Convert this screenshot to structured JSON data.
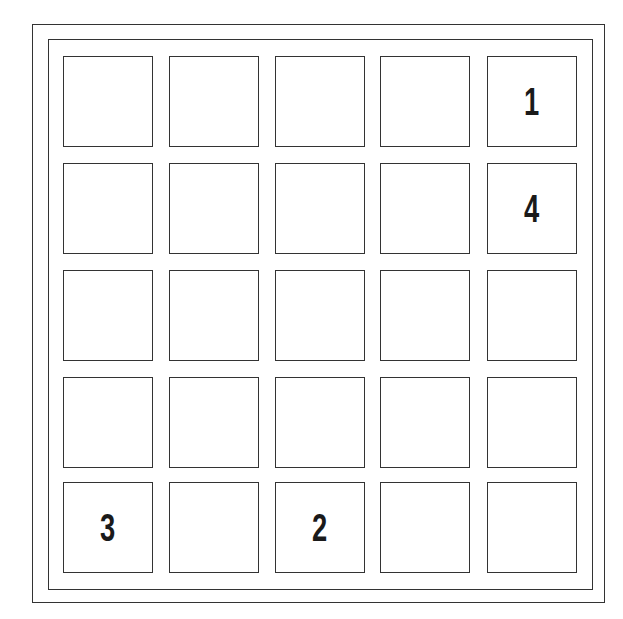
{
  "puzzle": {
    "rows": 5,
    "cols": 5,
    "cells": [
      [
        "",
        "",
        "",
        "",
        "1"
      ],
      [
        "",
        "",
        "",
        "",
        "4"
      ],
      [
        "",
        "",
        "",
        "",
        ""
      ],
      [
        "",
        "",
        "",
        "",
        ""
      ],
      [
        "3",
        "",
        "2",
        "",
        ""
      ]
    ]
  }
}
